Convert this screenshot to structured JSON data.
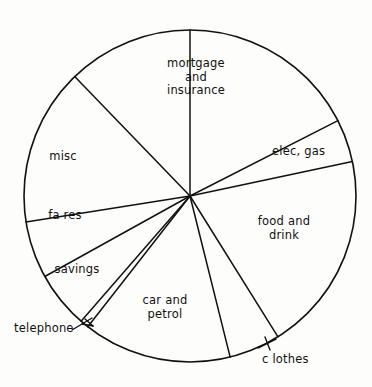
{
  "chart_data": {
    "type": "pie",
    "title": "",
    "subtitle": "",
    "xlabel": "",
    "ylabel": "",
    "legend_position": "none",
    "grid": false,
    "labels_inside": true,
    "units": "percent of total budget",
    "categories": [
      "mortgage and insurance",
      "elec, gas",
      "food and drink",
      "clothes",
      "car and petrol",
      "telephone",
      "savings",
      "fares",
      "misc"
    ],
    "values": [
      17.5,
      4.2,
      19.4,
      5.0,
      14.4,
      0.8,
      5.6,
      5.6,
      15.3
    ],
    "angles_deg": [
      63,
      15,
      70,
      18,
      52,
      3,
      20,
      20,
      55
    ],
    "start_angles_deg": [
      0,
      63,
      78,
      148,
      166,
      218,
      221,
      241,
      261
    ],
    "colors": [
      "#ffffff",
      "#ffffff",
      "#ffffff",
      "#ffffff",
      "#ffffff",
      "#ffffff",
      "#ffffff",
      "#ffffff",
      "#ffffff"
    ],
    "stroke_color": "#111111",
    "background_color": "#fdfdfb"
  },
  "figure": {
    "center_x": 190,
    "center_y": 196,
    "radius": 166
  },
  "labels": {
    "mortgage": "mortgage\nand\ninsurance",
    "elec_gas": "elec, gas",
    "food_drink": "food and\ndrink",
    "clothes": "c lothes",
    "car_petrol": "car and\npetrol",
    "telephone": "telephone",
    "savings": "savings",
    "fares": "fa res",
    "misc": "misc"
  },
  "slices": [
    {
      "key": "mortgage",
      "label": "mortgage and insurance",
      "value": 17.5,
      "start_deg": 0,
      "end_deg": 63
    },
    {
      "key": "elec_gas",
      "label": "elec, gas",
      "value": 4.2,
      "start_deg": 63,
      "end_deg": 78
    },
    {
      "key": "food_drink",
      "label": "food and drink",
      "value": 19.4,
      "start_deg": 78,
      "end_deg": 148
    },
    {
      "key": "clothes",
      "label": "clothes",
      "value": 5.0,
      "start_deg": 148,
      "end_deg": 166
    },
    {
      "key": "car_petrol",
      "label": "car and petrol",
      "value": 14.4,
      "start_deg": 166,
      "end_deg": 218
    },
    {
      "key": "telephone",
      "label": "telephone",
      "value": 0.8,
      "start_deg": 218,
      "end_deg": 221
    },
    {
      "key": "savings",
      "label": "savings",
      "value": 5.6,
      "start_deg": 221,
      "end_deg": 241
    },
    {
      "key": "fares",
      "label": "fares",
      "value": 5.6,
      "start_deg": 241,
      "end_deg": 261
    },
    {
      "key": "misc",
      "label": "misc",
      "value": 15.3,
      "start_deg": 261,
      "end_deg": 316
    }
  ]
}
